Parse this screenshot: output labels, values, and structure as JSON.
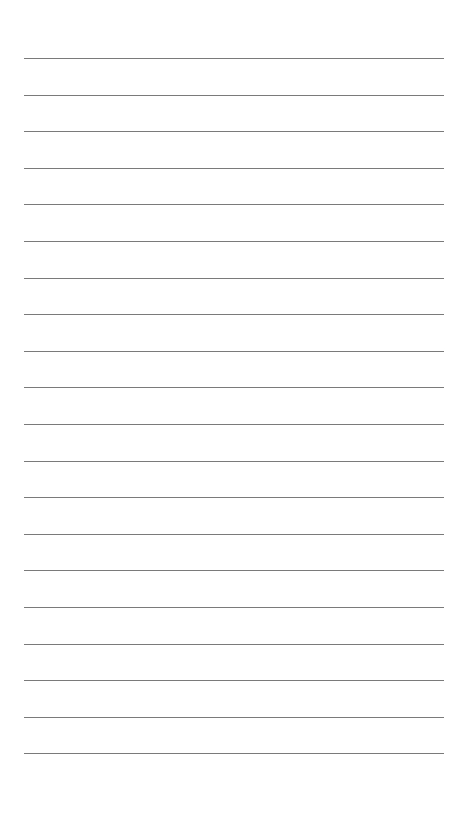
{
  "page": {
    "type": "lined-paper",
    "background_color": "#ffffff",
    "line_color": "#7a7a7a",
    "line_count": 20,
    "first_line_y": 58,
    "line_spacing": 36.6,
    "line_left": 24,
    "line_width": 420,
    "text": ""
  }
}
